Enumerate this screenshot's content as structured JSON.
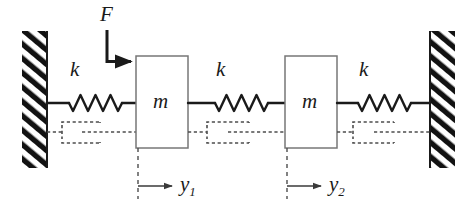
{
  "figure": {
    "name": "two-mass three-spring damped system",
    "type": "free-body-schematic",
    "colors": {
      "stroke": "#1a1a1a",
      "box_stroke": "#6e6e6e",
      "dashed": "#4d4d4d",
      "background": "#ffffff"
    }
  },
  "labels": {
    "force": "F",
    "spring_left": "k",
    "spring_middle": "k",
    "spring_right": "k",
    "mass_left": "m",
    "mass_right": "m",
    "displacement_1": "y",
    "displacement_1_sub": "1",
    "displacement_2": "y",
    "displacement_2_sub": "2"
  },
  "elements": {
    "wall_left": "fixed-support-hatched",
    "wall_right": "fixed-support-hatched",
    "spring_count": 3,
    "mass_count": 2,
    "damper_count": 3,
    "force_arrow": "downward-then-rightward-applied-to-mass-1",
    "displacement_arrows": 2
  }
}
